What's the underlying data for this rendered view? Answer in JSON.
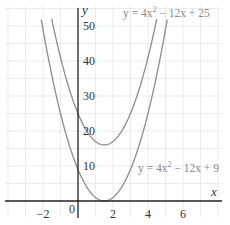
{
  "chart_data": {
    "type": "line",
    "title": "",
    "xlabel": "x",
    "ylabel": "y",
    "xlim": [
      -4.2,
      8.2
    ],
    "ylim": [
      -5,
      55
    ],
    "grid": true,
    "x_ticks": [
      -2,
      0,
      2,
      4,
      6
    ],
    "x_tick_labels": [
      "−2",
      "0",
      "2",
      "4",
      "6"
    ],
    "y_ticks": [
      10,
      20,
      30,
      40,
      50
    ],
    "y_tick_labels": [
      "10",
      "20",
      "30",
      "40",
      "50"
    ],
    "series": [
      {
        "name": "y = 4x² − 12x + 25",
        "coefficients": {
          "a": 4,
          "b": -12,
          "c": 25
        },
        "x_range": [
          -1.5,
          4.5
        ],
        "vertex": [
          1.5,
          16
        ],
        "x": [
          -1.5,
          -1,
          -0.5,
          0,
          0.5,
          1,
          1.5,
          2,
          2.5,
          3,
          3.5,
          4,
          4.5
        ],
        "values": [
          52,
          41,
          32,
          25,
          20,
          17,
          16,
          17,
          20,
          25,
          32,
          41,
          52
        ],
        "label_position": "top-right"
      },
      {
        "name": "y = 4x² − 12x + 9",
        "coefficients": {
          "a": 4,
          "b": -12,
          "c": 9
        },
        "x_range": [
          -2.1,
          5.1
        ],
        "vertex": [
          1.5,
          0
        ],
        "x": [
          -2,
          -1.5,
          -1,
          -0.5,
          0,
          0.5,
          1,
          1.5,
          2,
          2.5,
          3,
          3.5,
          4,
          4.5,
          5
        ],
        "values": [
          49,
          36,
          25,
          16,
          9,
          4,
          1,
          0,
          1,
          4,
          9,
          16,
          25,
          36,
          49
        ],
        "label_position": "right"
      }
    ],
    "annotations": [
      {
        "text": "y = 4x² − 12x + 25",
        "near": [
          4.5,
          52
        ]
      },
      {
        "text": "y = 4x² − 12x + 9",
        "near": [
          5.5,
          11
        ]
      }
    ]
  },
  "labels": {
    "x_axis": "x",
    "y_axis": "y",
    "origin": "0",
    "eq_upper_prefix": "y = 4x",
    "eq_upper_suffix": " − 12x + 25",
    "eq_lower_prefix": "y = 4x",
    "eq_lower_suffix": " − 12x + 9",
    "sup": "2"
  },
  "colors": {
    "curve": "#8c8c8c",
    "axis": "#222222",
    "grid": "#e6e6e6",
    "equation_text": "#8a8a8a"
  }
}
